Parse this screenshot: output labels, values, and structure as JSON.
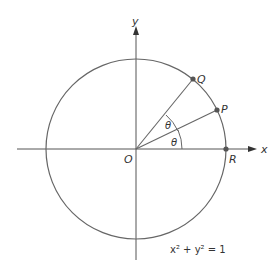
{
  "diagram": {
    "axes": {
      "x_label": "x",
      "y_label": "y",
      "origin_label": "O"
    },
    "points": [
      {
        "name": "Q",
        "label": "Q"
      },
      {
        "name": "P",
        "label": "P"
      },
      {
        "name": "R",
        "label": "R"
      }
    ],
    "angles": [
      {
        "label": "θ"
      },
      {
        "label": "θ"
      }
    ],
    "equation": "x² + y² = 1",
    "colors": {
      "line": "#666666",
      "point": "#555555"
    }
  }
}
